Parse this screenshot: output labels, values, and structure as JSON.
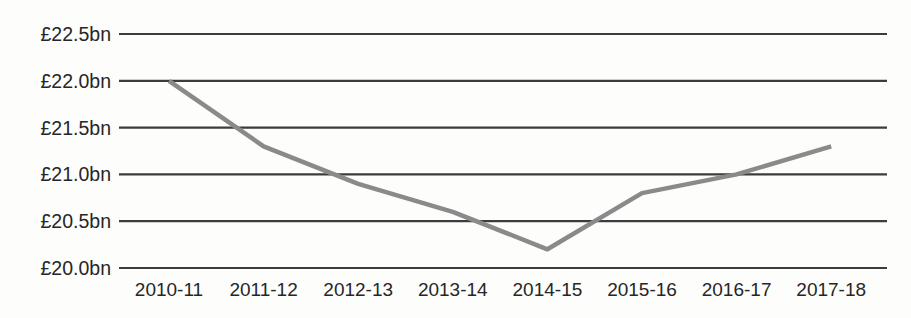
{
  "chart_data": {
    "type": "line",
    "title": "",
    "xlabel": "",
    "ylabel": "",
    "categories": [
      "2010-11",
      "2011-12",
      "2012-13",
      "2013-14",
      "2014-15",
      "2015-16",
      "2016-17",
      "2017-18"
    ],
    "series": [
      {
        "name": "spending",
        "values": [
          22.0,
          21.3,
          20.9,
          20.6,
          20.2,
          20.8,
          21.0,
          21.3
        ]
      }
    ],
    "ylim": [
      20.0,
      22.5
    ],
    "y_ticks": [
      {
        "value": 22.5,
        "label": "£22.5bn"
      },
      {
        "value": 22.0,
        "label": "£22.0bn"
      },
      {
        "value": 21.5,
        "label": "£21.5bn"
      },
      {
        "value": 21.0,
        "label": "£21.0bn"
      },
      {
        "value": 20.5,
        "label": "£20.5bn"
      },
      {
        "value": 20.0,
        "label": "£20.0bn"
      }
    ],
    "grid": "horizontal-only",
    "legend": "none",
    "colors": {
      "line": "#8a8a8a",
      "gridline": "#3c3c3c",
      "text": "#262626",
      "background": "#fdfdfc"
    }
  }
}
